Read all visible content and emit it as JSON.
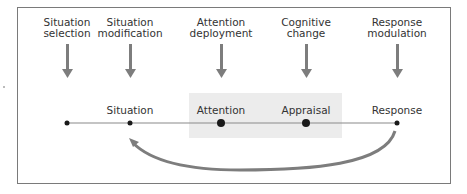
{
  "diagram": {
    "strategies": [
      {
        "line1": "Situation",
        "line2": "selection",
        "x": 67
      },
      {
        "line1": "Situation",
        "line2": "modification",
        "x": 130
      },
      {
        "line1": "Attention",
        "line2": "deployment",
        "x": 221
      },
      {
        "line1": "Cognitive",
        "line2": "change",
        "x": 306
      },
      {
        "line1": "Response",
        "line2": "modulation",
        "x": 397
      }
    ],
    "stages": [
      {
        "label": "Situation",
        "x": 130
      },
      {
        "label": "Attention",
        "x": 221
      },
      {
        "label": "Appraisal",
        "x": 306
      },
      {
        "label": "Response",
        "x": 397
      }
    ],
    "timeline_points": [
      67,
      130,
      221,
      306,
      397
    ],
    "feedback_arrow": {
      "from": "Response",
      "to": "Situation"
    },
    "colors": {
      "arrow": "#7d7d7d",
      "timeline": "#8a8a8a",
      "dot": "#1a1a1a",
      "shade": "#ececec",
      "frame": "#7a7a7a",
      "text": "#333333"
    }
  }
}
